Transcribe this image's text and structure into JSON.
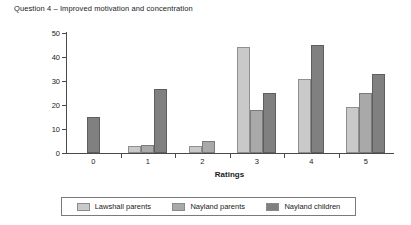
{
  "chart_data": {
    "type": "bar",
    "title": "Question 4 – Improved motivation and concentration",
    "xlabel": "Ratings",
    "ylabel": "Percentage scores",
    "categories": [
      "0",
      "1",
      "2",
      "3",
      "4",
      "5"
    ],
    "ylim": [
      0,
      50
    ],
    "yticks": [
      0,
      10,
      20,
      30,
      40,
      50
    ],
    "grid": false,
    "legend_position": "bottom",
    "series": [
      {
        "name": "Lawshall parents",
        "color": "#c9c9c9",
        "values": [
          0,
          3,
          3,
          44,
          31,
          19
        ]
      },
      {
        "name": "Nayland parents",
        "color": "#a9a9a9",
        "values": [
          0,
          3.5,
          5,
          18,
          0,
          25
        ]
      },
      {
        "name": "Nayland children",
        "color": "#808080",
        "values": [
          15,
          26.5,
          0,
          25,
          45,
          33
        ]
      }
    ]
  }
}
